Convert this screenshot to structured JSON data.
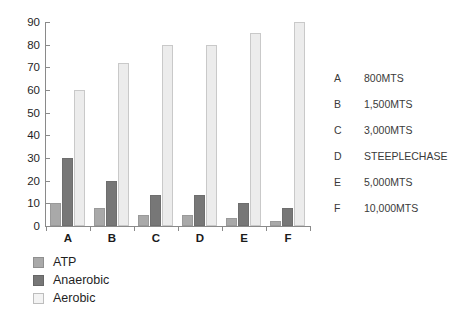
{
  "chart_data": {
    "type": "bar",
    "title": "",
    "xlabel": "",
    "ylabel": "",
    "ylim": [
      0,
      90
    ],
    "yticks": [
      0,
      10,
      20,
      30,
      40,
      50,
      60,
      70,
      80,
      90
    ],
    "grid": false,
    "legend_position": "bottom-left",
    "categories": [
      "A",
      "B",
      "C",
      "D",
      "E",
      "F"
    ],
    "series": [
      {
        "name": "ATP",
        "color": "#a9a9a9",
        "values": [
          10,
          8,
          5,
          5,
          3.5,
          2
        ]
      },
      {
        "name": "Anaerobic",
        "color": "#777777",
        "values": [
          30,
          20,
          13.5,
          13.5,
          10,
          8
        ]
      },
      {
        "name": "Aerobic",
        "color": "#ececec",
        "values": [
          60,
          72,
          80,
          80,
          85,
          90
        ]
      }
    ]
  },
  "axis": {
    "y_tick_labels": [
      "90",
      "80",
      "70",
      "60",
      "50",
      "40",
      "30",
      "20",
      "10",
      "0"
    ],
    "x_tick_labels": [
      "A",
      "B",
      "C",
      "D",
      "E",
      "F"
    ]
  },
  "legend": {
    "items": [
      {
        "label": "ATP",
        "swatch": "atp"
      },
      {
        "label": "Anaerobic",
        "swatch": "anaerobic"
      },
      {
        "label": "Aerobic",
        "swatch": "aerobic"
      }
    ]
  },
  "key": {
    "rows": [
      {
        "letter": "A",
        "value": "800MTS"
      },
      {
        "letter": "B",
        "value": "1,500MTS"
      },
      {
        "letter": "C",
        "value": "3,000MTS"
      },
      {
        "letter": "D",
        "value": "STEEPLECHASE"
      },
      {
        "letter": "E",
        "value": "5,000MTS"
      },
      {
        "letter": "F",
        "value": "10,000MTS"
      }
    ]
  }
}
